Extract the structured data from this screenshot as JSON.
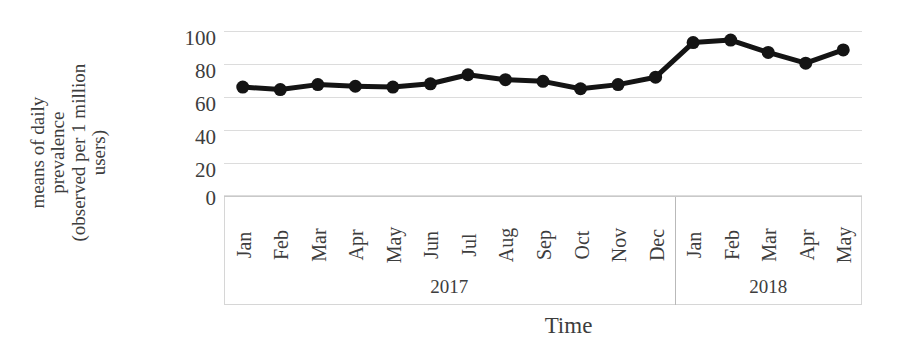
{
  "chart_data": {
    "type": "line",
    "title": "",
    "subtitle": "",
    "xlabel": "Time",
    "ylabel": "means of daily prevalence (observed per 1 million users)",
    "ylabel_lines": [
      "means of daily",
      "prevalence",
      "(observed per 1 million",
      "users)"
    ],
    "ylim": [
      0,
      100
    ],
    "yticks": [
      100,
      80,
      60,
      40,
      20,
      0
    ],
    "grid": true,
    "legend": "none",
    "marker": "filled-circle",
    "line_color": "#1a1a1a",
    "grid_color": "#dcdcdc",
    "categories": [
      "Jan",
      "Feb",
      "Mar",
      "Apr",
      "May",
      "Jun",
      "Jul",
      "Aug",
      "Sep",
      "Oct",
      "Nov",
      "Dec",
      "Jan",
      "Feb",
      "Mar",
      "Apr",
      "May"
    ],
    "values": [
      66,
      64.5,
      67.5,
      66.5,
      66,
      68,
      73.5,
      70.5,
      69.5,
      65,
      67.5,
      72,
      93,
      94.5,
      87,
      80.5,
      88.5
    ],
    "group_labels": [
      "2017",
      "2018"
    ],
    "group_spans": [
      12,
      5
    ],
    "series": [
      {
        "name": "means of daily prevalence",
        "values": [
          66,
          64.5,
          67.5,
          66.5,
          66,
          68,
          73.5,
          70.5,
          69.5,
          65,
          67.5,
          72,
          93,
          94.5,
          87,
          80.5,
          88.5
        ]
      }
    ]
  },
  "axes": {
    "y_title_lines": [
      "means of daily",
      "prevalence",
      "(observed per 1 million",
      "users)"
    ],
    "y_ticks": [
      "100",
      "80",
      "60",
      "40",
      "20",
      "0"
    ],
    "x_title": "Time"
  },
  "months": [
    "Jan",
    "Feb",
    "Mar",
    "Apr",
    "May",
    "Jun",
    "Jul",
    "Aug",
    "Sep",
    "Oct",
    "Nov",
    "Dec",
    "Jan",
    "Feb",
    "Mar",
    "Apr",
    "May"
  ],
  "years": [
    {
      "label": "2017"
    },
    {
      "label": "2018"
    }
  ]
}
